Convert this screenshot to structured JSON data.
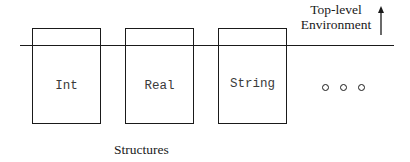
{
  "diagram": {
    "environment_label_line1": "Top-level",
    "environment_label_line2": "Environment",
    "environment_arrow": "arrow-up-icon",
    "structures_label": "Structures",
    "boxes": [
      {
        "label": "Int"
      },
      {
        "label": "Real"
      },
      {
        "label": "String"
      }
    ],
    "ellipsis": "o o o",
    "colors": {
      "stroke": "#1a1a1a",
      "box_text": "#3a3a3a",
      "background": "#ffffff"
    }
  }
}
